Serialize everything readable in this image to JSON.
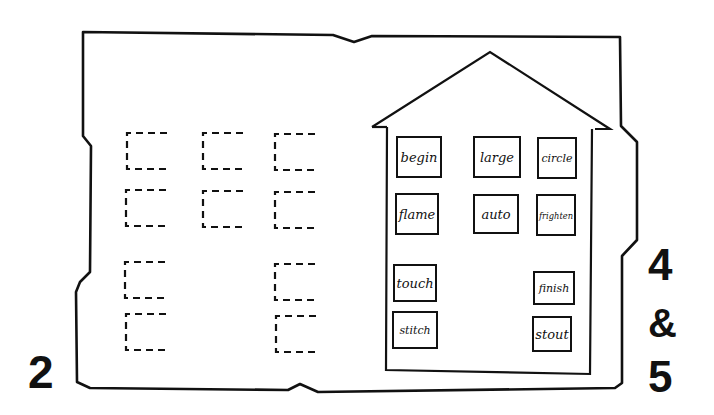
{
  "page_labels": {
    "left": "2",
    "right_top": "4",
    "right_amp": "&",
    "right_bottom": "5"
  },
  "house": {
    "cards": [
      {
        "word": "begin"
      },
      {
        "word": "large"
      },
      {
        "word": "circle"
      },
      {
        "word": "flame"
      },
      {
        "word": "auto"
      },
      {
        "word": "frighten"
      },
      {
        "word": "touch"
      },
      {
        "word": "finish"
      },
      {
        "word": "stitch"
      },
      {
        "word": "stout"
      }
    ]
  },
  "placeholders": {
    "count": 10,
    "style": "dashed-bracket"
  },
  "colors": {
    "ink": "#111111",
    "paper": "#ffffff"
  }
}
